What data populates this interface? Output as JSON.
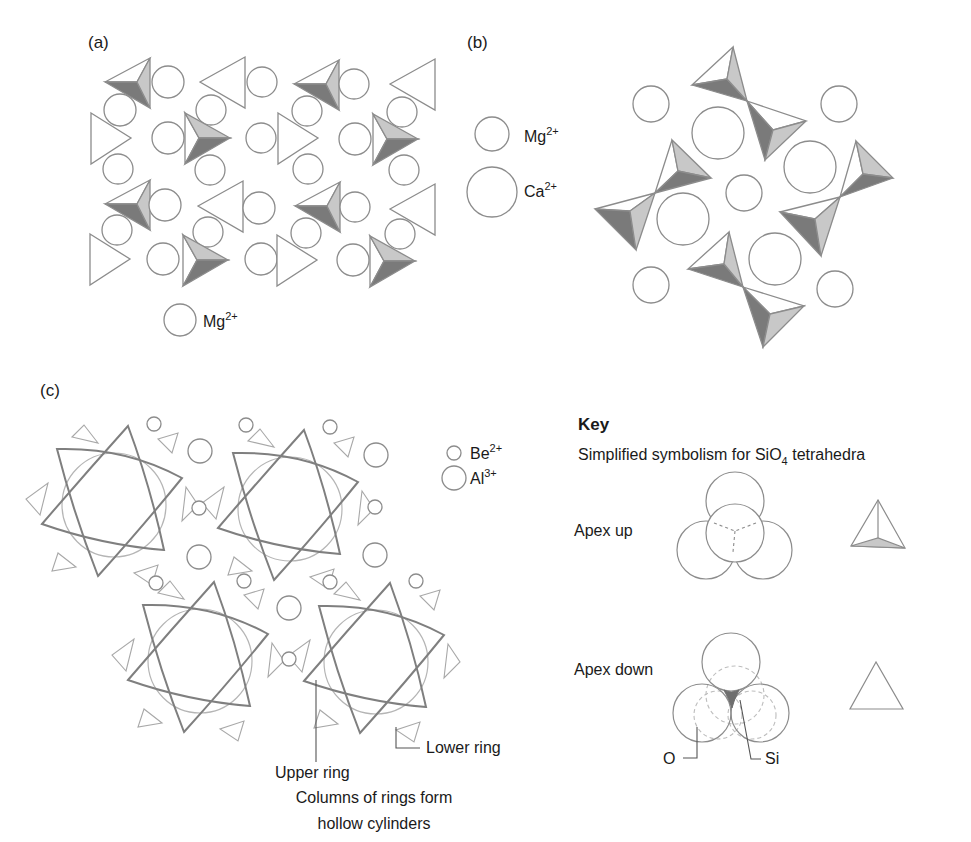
{
  "figure": {
    "colors": {
      "stroke": "#8c8c8c",
      "dark_face": "#7a7a7a",
      "light_face": "#c8c8c8",
      "ring_stroke": "#7f7f7f",
      "background": "#ffffff"
    }
  },
  "panels": {
    "a": {
      "label": "(a)",
      "legend": [
        {
          "symbol": "circle",
          "ion": "Mg",
          "charge": "2+"
        }
      ]
    },
    "b": {
      "label": "(b)",
      "legend": [
        {
          "symbol": "small-circle",
          "ion": "Mg",
          "charge": "2+"
        },
        {
          "symbol": "large-circle",
          "ion": "Ca",
          "charge": "2+"
        }
      ]
    },
    "c": {
      "label": "(c)",
      "legend": [
        {
          "symbol": "small-circle",
          "ion": "Be",
          "charge": "2+"
        },
        {
          "symbol": "large-circle",
          "ion": "Al",
          "charge": "3+"
        }
      ],
      "annotations": {
        "upper_ring": "Upper ring",
        "lower_ring": "Lower ring",
        "caption_line1": "Columns of rings form",
        "caption_line2": "hollow cylinders"
      }
    }
  },
  "key": {
    "title": "Key",
    "subtitle_prefix": "Simplified symbolism for SiO",
    "subtitle_subscript": "4",
    "subtitle_suffix": " tetrahedra",
    "apex_up_label": "Apex up",
    "apex_down_label": "Apex down",
    "oxygen_label": "O",
    "silicon_label": "Si"
  }
}
